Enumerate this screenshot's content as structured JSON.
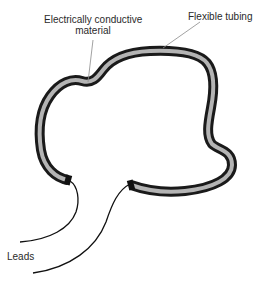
{
  "diagram": {
    "labels": {
      "conductive_line1": "Electrically conductive",
      "conductive_line2": "material",
      "tubing": "Flexible tubing",
      "leads": "Leads"
    },
    "colors": {
      "tube_outline": "#1a1a1a",
      "tube_fill": "#b4b4b4",
      "leader_line": "#8a8a8a",
      "lead_wire": "#111111",
      "text": "#2a2a2a"
    }
  }
}
